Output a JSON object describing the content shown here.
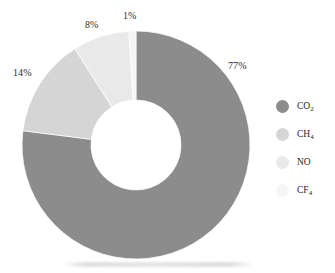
{
  "chart_data": {
    "type": "pie",
    "variant": "donut",
    "title": "",
    "subtitle": "",
    "xlabel": "",
    "ylabel": "",
    "categories": [
      "CO2",
      "CH4",
      "NO",
      "CF4"
    ],
    "values": [
      77,
      14,
      8,
      1
    ],
    "value_unit": "%",
    "data_labels": [
      "77%",
      "14%",
      "8%",
      "1%"
    ],
    "slices": [
      {
        "name": "CO2",
        "legend_label": "CO",
        "legend_sub": "2",
        "value": 77,
        "data_label": "77%",
        "color": "#8c8c8c",
        "start_angle_deg": 0,
        "end_angle_deg": 277.2
      },
      {
        "name": "CH4",
        "legend_label": "CH",
        "legend_sub": "4",
        "value": 14,
        "data_label": "14%",
        "color": "#d5d5d5",
        "start_angle_deg": 277.2,
        "end_angle_deg": 327.6
      },
      {
        "name": "NO",
        "legend_label": "NO",
        "legend_sub": "",
        "value": 8,
        "data_label": "8%",
        "color": "#e9e9e9",
        "start_angle_deg": 327.6,
        "end_angle_deg": 356.4
      },
      {
        "name": "CF4",
        "legend_label": "CF",
        "legend_sub": "4",
        "value": 1,
        "data_label": "1%",
        "color": "#f5f5f5",
        "start_angle_deg": 356.4,
        "end_angle_deg": 360
      }
    ],
    "legend": {
      "position": "right",
      "entries": [
        {
          "label": "CO",
          "sub": "2",
          "color": "#8c8c8c"
        },
        {
          "label": "CH",
          "sub": "4",
          "color": "#d5d5d5"
        },
        {
          "label": "NO",
          "sub": "",
          "color": "#e9e9e9"
        },
        {
          "label": "CF",
          "sub": "4",
          "color": "#f5f5f5"
        }
      ]
    },
    "grid": false,
    "background_color": "#ffffff",
    "label_color": "#2b2b2b"
  },
  "geometry": {
    "center_x": 136,
    "center_y": 145,
    "outer_radius": 114,
    "inner_radius": 45,
    "start_at_deg": 0,
    "direction": "clockwise"
  },
  "labels": {
    "co2_pct": "77%",
    "ch4_pct": "14%",
    "no_pct": "8%",
    "cf4_pct": "1%"
  },
  "legend_text": {
    "co2_main": "CO",
    "co2_sub": "2",
    "ch4_main": "CH",
    "ch4_sub": "4",
    "no_main": "NO",
    "no_sub": "",
    "cf4_main": "CF",
    "cf4_sub": "4"
  }
}
